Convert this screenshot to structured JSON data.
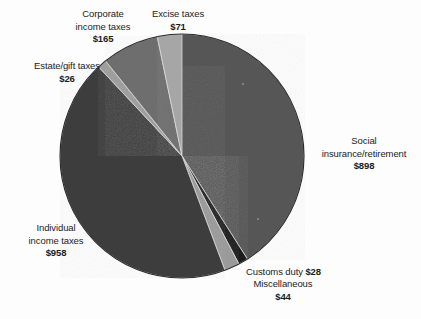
{
  "chart_data": {
    "type": "pie",
    "title": "",
    "subtitle": "",
    "xlabel": "",
    "ylabel": "",
    "legend_position": "callouts",
    "grid": false,
    "unit": "$ billions",
    "total": 2190,
    "categories": [
      "Social insurance/retirement",
      "Customs duty",
      "Miscellaneous",
      "Individual income taxes",
      "Estate/gift taxes",
      "Corporate income taxes",
      "Excise taxes"
    ],
    "values": [
      898,
      28,
      44,
      958,
      26,
      165,
      71
    ],
    "slices": [
      {
        "name": "social-insurance",
        "label": "Social insurance/retirement",
        "label_line1": "Social",
        "label_line2": "insurance/retirement",
        "value_text": "$898",
        "value": 898,
        "percent": 41.0,
        "start_angle": 0,
        "end_angle": 147.6,
        "color": "#565656"
      },
      {
        "name": "customs-duty",
        "label": "Customs duty",
        "label_line1": "Customs duty",
        "label_line2": "",
        "value_text": "$28",
        "value": 28,
        "percent": 1.3,
        "start_angle": 147.6,
        "end_angle": 152.2,
        "color": "#1b1b1b"
      },
      {
        "name": "miscellaneous",
        "label": "Miscellaneous",
        "label_line1": "Miscellaneous",
        "label_line2": "",
        "value_text": "$44",
        "value": 44,
        "percent": 2.0,
        "start_angle": 152.2,
        "end_angle": 159.4,
        "color": "#9a9a9a"
      },
      {
        "name": "individual-income-taxes",
        "label": "Individual income taxes",
        "label_line1": "Individual",
        "label_line2": "income taxes",
        "value_text": "$958",
        "value": 958,
        "percent": 43.7,
        "start_angle": 159.4,
        "end_angle": 316.9,
        "color": "#3c3c3c"
      },
      {
        "name": "estate-gift-taxes",
        "label": "Estate/gift taxes",
        "label_line1": "Estate/gift taxes",
        "label_line2": "",
        "value_text": "$26",
        "value": 26,
        "percent": 1.2,
        "start_angle": 316.9,
        "end_angle": 321.2,
        "color": "#9d9d9d"
      },
      {
        "name": "corporate-income-taxes",
        "label": "Corporate income taxes",
        "label_line1": "Corporate",
        "label_line2": "income taxes",
        "value_text": "$165",
        "value": 165,
        "percent": 7.5,
        "start_angle": 321.2,
        "end_angle": 348.3,
        "color": "#6e6e6e"
      },
      {
        "name": "excise-taxes",
        "label": "Excise taxes",
        "label_line1": "Excise taxes",
        "label_line2": "",
        "value_text": "$71",
        "value": 71,
        "percent": 3.2,
        "start_angle": 348.3,
        "end_angle": 360,
        "color": "#a6a6a6"
      }
    ]
  },
  "geometry": {
    "center_x": 182,
    "center_y": 156,
    "radius": 122
  },
  "colors": {
    "background": "#fdfdfd",
    "text": "#1c1c1c",
    "outline": "#2b2b2b"
  }
}
